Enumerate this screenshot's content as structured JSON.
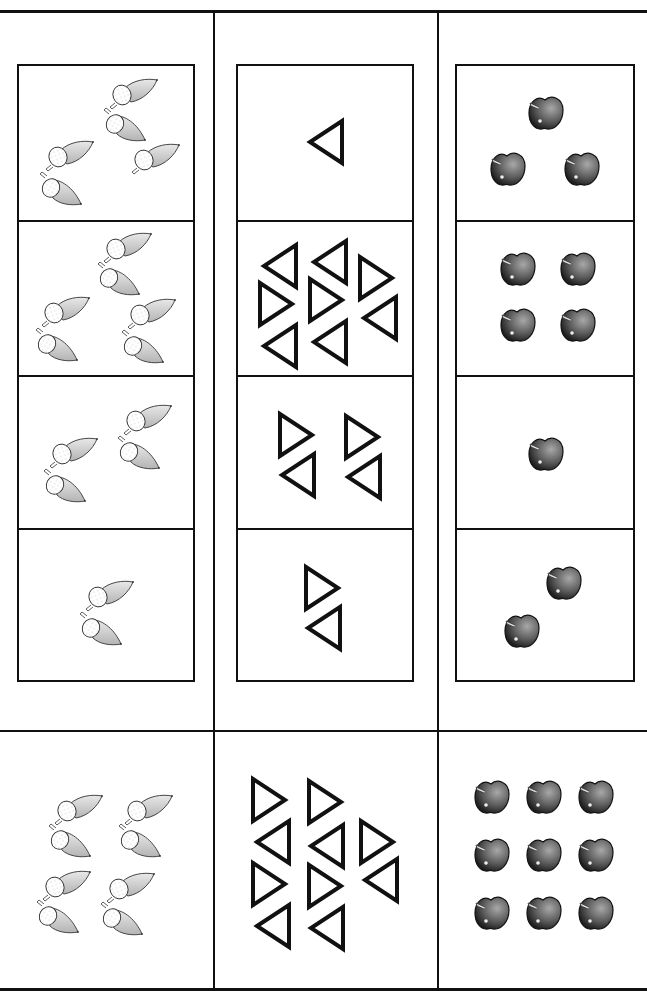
{
  "worksheet": {
    "title": "Counting worksheet: acorns, triangles, apples",
    "columns": [
      {
        "name": "acorns",
        "box": {
          "x": 17,
          "y": 64,
          "w": 178,
          "h": 618
        },
        "rows_y": [
          0,
          154,
          309,
          462
        ],
        "cells": [
          {
            "count": 5,
            "items": [
              {
                "t": "acorn-up",
                "x": 88,
                "y": 10
              },
              {
                "t": "acorn-down",
                "x": 82,
                "y": 40
              },
              {
                "t": "acorn-up",
                "x": 110,
                "y": 75
              },
              {
                "t": "acorn-up",
                "x": 24,
                "y": 72
              },
              {
                "t": "acorn-down",
                "x": 18,
                "y": 104
              }
            ]
          },
          {
            "count": 6,
            "items": [
              {
                "t": "acorn-up",
                "x": 82,
                "y": 8
              },
              {
                "t": "acorn-down",
                "x": 76,
                "y": 38
              },
              {
                "t": "acorn-up",
                "x": 20,
                "y": 72
              },
              {
                "t": "acorn-down",
                "x": 14,
                "y": 104
              },
              {
                "t": "acorn-up",
                "x": 106,
                "y": 74
              },
              {
                "t": "acorn-down",
                "x": 100,
                "y": 106
              }
            ]
          },
          {
            "count": 4,
            "items": [
              {
                "t": "acorn-up",
                "x": 102,
                "y": 25
              },
              {
                "t": "acorn-down",
                "x": 96,
                "y": 57
              },
              {
                "t": "acorn-up",
                "x": 28,
                "y": 58
              },
              {
                "t": "acorn-down",
                "x": 22,
                "y": 90
              }
            ]
          },
          {
            "count": 2,
            "items": [
              {
                "t": "acorn-up",
                "x": 64,
                "y": 48
              },
              {
                "t": "acorn-down",
                "x": 58,
                "y": 80
              }
            ]
          }
        ]
      },
      {
        "name": "triangles",
        "box": {
          "x": 236,
          "y": 64,
          "w": 178,
          "h": 618
        },
        "rows_y": [
          0,
          154,
          309,
          462
        ],
        "cells": [
          {
            "count": 1,
            "items": [
              {
                "t": "tri-left",
                "x": 68,
                "y": 52
              }
            ]
          },
          {
            "count": 9,
            "items": [
              {
                "t": "tri-left",
                "x": 22,
                "y": 20
              },
              {
                "t": "tri-left",
                "x": 72,
                "y": 16
              },
              {
                "t": "tri-right",
                "x": 118,
                "y": 32
              },
              {
                "t": "tri-right",
                "x": 18,
                "y": 58
              },
              {
                "t": "tri-right",
                "x": 68,
                "y": 54
              },
              {
                "t": "tri-left",
                "x": 122,
                "y": 72
              },
              {
                "t": "tri-left",
                "x": 22,
                "y": 100
              },
              {
                "t": "tri-left",
                "x": 72,
                "y": 96
              }
            ]
          },
          {
            "count": 4,
            "items": [
              {
                "t": "tri-right",
                "x": 38,
                "y": 34
              },
              {
                "t": "tri-left",
                "x": 40,
                "y": 74
              },
              {
                "t": "tri-right",
                "x": 104,
                "y": 36
              },
              {
                "t": "tri-left",
                "x": 106,
                "y": 76
              }
            ]
          },
          {
            "count": 2,
            "items": [
              {
                "t": "tri-right",
                "x": 64,
                "y": 34
              },
              {
                "t": "tri-left",
                "x": 66,
                "y": 74
              }
            ]
          }
        ]
      },
      {
        "name": "apples",
        "box": {
          "x": 455,
          "y": 64,
          "w": 180,
          "h": 618
        },
        "rows_y": [
          0,
          154,
          309,
          462
        ],
        "cells": [
          {
            "count": 3,
            "items": [
              {
                "t": "apple",
                "x": 68,
                "y": 26
              },
              {
                "t": "apple",
                "x": 30,
                "y": 82
              },
              {
                "t": "apple",
                "x": 104,
                "y": 82
              }
            ]
          },
          {
            "count": 4,
            "items": [
              {
                "t": "apple",
                "x": 40,
                "y": 26
              },
              {
                "t": "apple",
                "x": 100,
                "y": 26
              },
              {
                "t": "apple",
                "x": 40,
                "y": 82
              },
              {
                "t": "apple",
                "x": 100,
                "y": 82
              }
            ]
          },
          {
            "count": 1,
            "items": [
              {
                "t": "apple",
                "x": 68,
                "y": 56
              }
            ]
          },
          {
            "count": 2,
            "items": [
              {
                "t": "apple",
                "x": 86,
                "y": 32
              },
              {
                "t": "apple",
                "x": 44,
                "y": 80
              }
            ]
          }
        ]
      }
    ],
    "answer_row": {
      "y": 730,
      "cells": [
        {
          "name": "acorns-answer",
          "x": 0,
          "w": 213,
          "count": 8,
          "items": [
            {
              "t": "acorn-up",
              "x": 52,
              "y": 62
            },
            {
              "t": "acorn-down",
              "x": 46,
              "y": 92
            },
            {
              "t": "acorn-up",
              "x": 122,
              "y": 62
            },
            {
              "t": "acorn-down",
              "x": 116,
              "y": 92
            },
            {
              "t": "acorn-up",
              "x": 40,
              "y": 138
            },
            {
              "t": "acorn-down",
              "x": 34,
              "y": 168
            },
            {
              "t": "acorn-up",
              "x": 104,
              "y": 140
            },
            {
              "t": "acorn-down",
              "x": 98,
              "y": 170
            }
          ]
        },
        {
          "name": "triangles-answer",
          "x": 213,
          "w": 224,
          "count": 10,
          "items": [
            {
              "t": "tri-right",
              "x": 36,
              "y": 46
            },
            {
              "t": "tri-right",
              "x": 92,
              "y": 48
            },
            {
              "t": "tri-left",
              "x": 40,
              "y": 88
            },
            {
              "t": "tri-left",
              "x": 94,
              "y": 92
            },
            {
              "t": "tri-right",
              "x": 144,
              "y": 88
            },
            {
              "t": "tri-right",
              "x": 36,
              "y": 130
            },
            {
              "t": "tri-right",
              "x": 92,
              "y": 132
            },
            {
              "t": "tri-left",
              "x": 148,
              "y": 126
            },
            {
              "t": "tri-left",
              "x": 40,
              "y": 172
            },
            {
              "t": "tri-left",
              "x": 94,
              "y": 174
            }
          ]
        },
        {
          "name": "apples-answer",
          "x": 437,
          "w": 210,
          "count": 9,
          "items": [
            {
              "t": "apple",
              "x": 34,
              "y": 46
            },
            {
              "t": "apple",
              "x": 86,
              "y": 46
            },
            {
              "t": "apple",
              "x": 138,
              "y": 46
            },
            {
              "t": "apple",
              "x": 34,
              "y": 104
            },
            {
              "t": "apple",
              "x": 86,
              "y": 104
            },
            {
              "t": "apple",
              "x": 138,
              "y": 104
            },
            {
              "t": "apple",
              "x": 34,
              "y": 162
            },
            {
              "t": "apple",
              "x": 86,
              "y": 162
            },
            {
              "t": "apple",
              "x": 138,
              "y": 162
            }
          ]
        }
      ]
    },
    "frame": {
      "top_y": 10,
      "bottom_y": 988,
      "dividers_x": [
        213,
        437
      ]
    },
    "colors": {
      "ink": "#111111",
      "acorn_fill": "#cfcfcf",
      "apple_dark": "#2a2a2a",
      "apple_light": "#9a9a9a"
    }
  }
}
